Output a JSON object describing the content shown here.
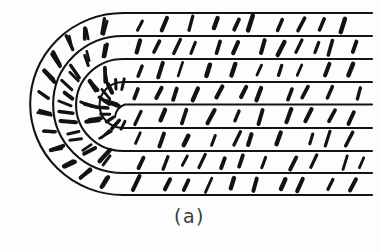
{
  "figure": {
    "caption": "(a)",
    "kind": "scientific-line-diagram",
    "background_color": "#fdfdfd",
    "ink_color": "#141414",
    "canvas": {
      "width": 379,
      "height": 252
    }
  },
  "geometry": {
    "layer_count": 9,
    "band_count": 8,
    "layer_y": [
      13,
      36,
      59,
      82,
      105,
      128,
      151,
      173,
      195
    ],
    "arc_center_x": 123,
    "arc_center_y": 104,
    "straight_right_x": 372,
    "outer_arc_left_x": 31,
    "innermost_arc_radius": 14,
    "layer_line_width": 2.1
  },
  "rods": {
    "description": "short thick black line segments representing molecular directors",
    "count_straight_region": 112,
    "count_curved_region": 64,
    "length_px": 13,
    "thickness_px": 3.4,
    "tilt_from_vertical_deg": 22,
    "color": "#121212"
  },
  "chart_data": {
    "type": "diagram",
    "title": "(a)",
    "annotations": [
      "(a)"
    ],
    "legend": [],
    "xlabel": "",
    "ylabel": ""
  }
}
